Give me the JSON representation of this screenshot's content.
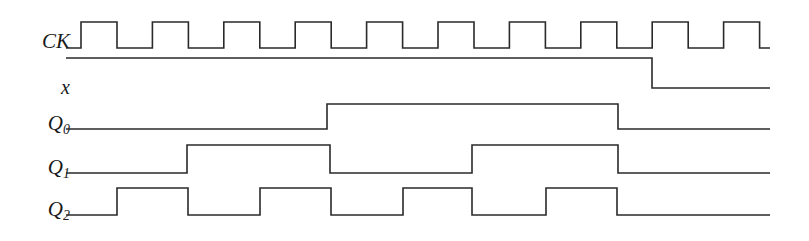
{
  "diagram": {
    "type": "digital-timing-diagram",
    "width": 809,
    "height": 241,
    "background_color": "#ffffff",
    "line_color": "#2a2a2a",
    "line_width": 1.6,
    "wave_start_x": 66,
    "wave_end_x": 770,
    "clock": {
      "period_px": 71.4,
      "first_rise_x": 81,
      "high_width_px": 36,
      "pulse_count": 10,
      "rising_edges": [
        81,
        152.4,
        223.8,
        295.2,
        366.6,
        438,
        509.4,
        580.8,
        652.2,
        723.6
      ]
    },
    "signals": [
      {
        "name": "CK",
        "label": "CK",
        "subscript": "",
        "label_x": 24,
        "label_center_y": 44,
        "high_y": 22,
        "low_y": 48,
        "initial_level": 0,
        "transitions": [
          81,
          117,
          152.4,
          188.4,
          223.8,
          259.8,
          295.2,
          331.2,
          366.6,
          402.6,
          438,
          474,
          509.4,
          545.4,
          580.8,
          616.8,
          652.2,
          688.2,
          723.6,
          759.6
        ]
      },
      {
        "name": "x",
        "label": "x",
        "subscript": "",
        "label_x": 45,
        "label_center_y": 88,
        "high_y": 58,
        "low_y": 88,
        "initial_level": 1,
        "transitions": [
          652
        ]
      },
      {
        "name": "Q0",
        "label": "Q",
        "subscript": "0",
        "label_x": 22,
        "label_center_y": 126,
        "high_y": 104,
        "low_y": 129,
        "initial_level": 0,
        "transitions": [
          327,
          618
        ]
      },
      {
        "name": "Q1",
        "label": "Q",
        "subscript": "1",
        "label_x": 22,
        "label_center_y": 170,
        "high_y": 145,
        "low_y": 173,
        "initial_level": 0,
        "transitions": [
          187,
          330,
          472,
          618
        ]
      },
      {
        "name": "Q2",
        "label": "Q",
        "subscript": "2",
        "label_x": 22,
        "label_center_y": 212,
        "high_y": 188,
        "low_y": 215,
        "initial_level": 0,
        "transitions": [
          117,
          188,
          260,
          331,
          403,
          472,
          546,
          617
        ]
      }
    ]
  }
}
